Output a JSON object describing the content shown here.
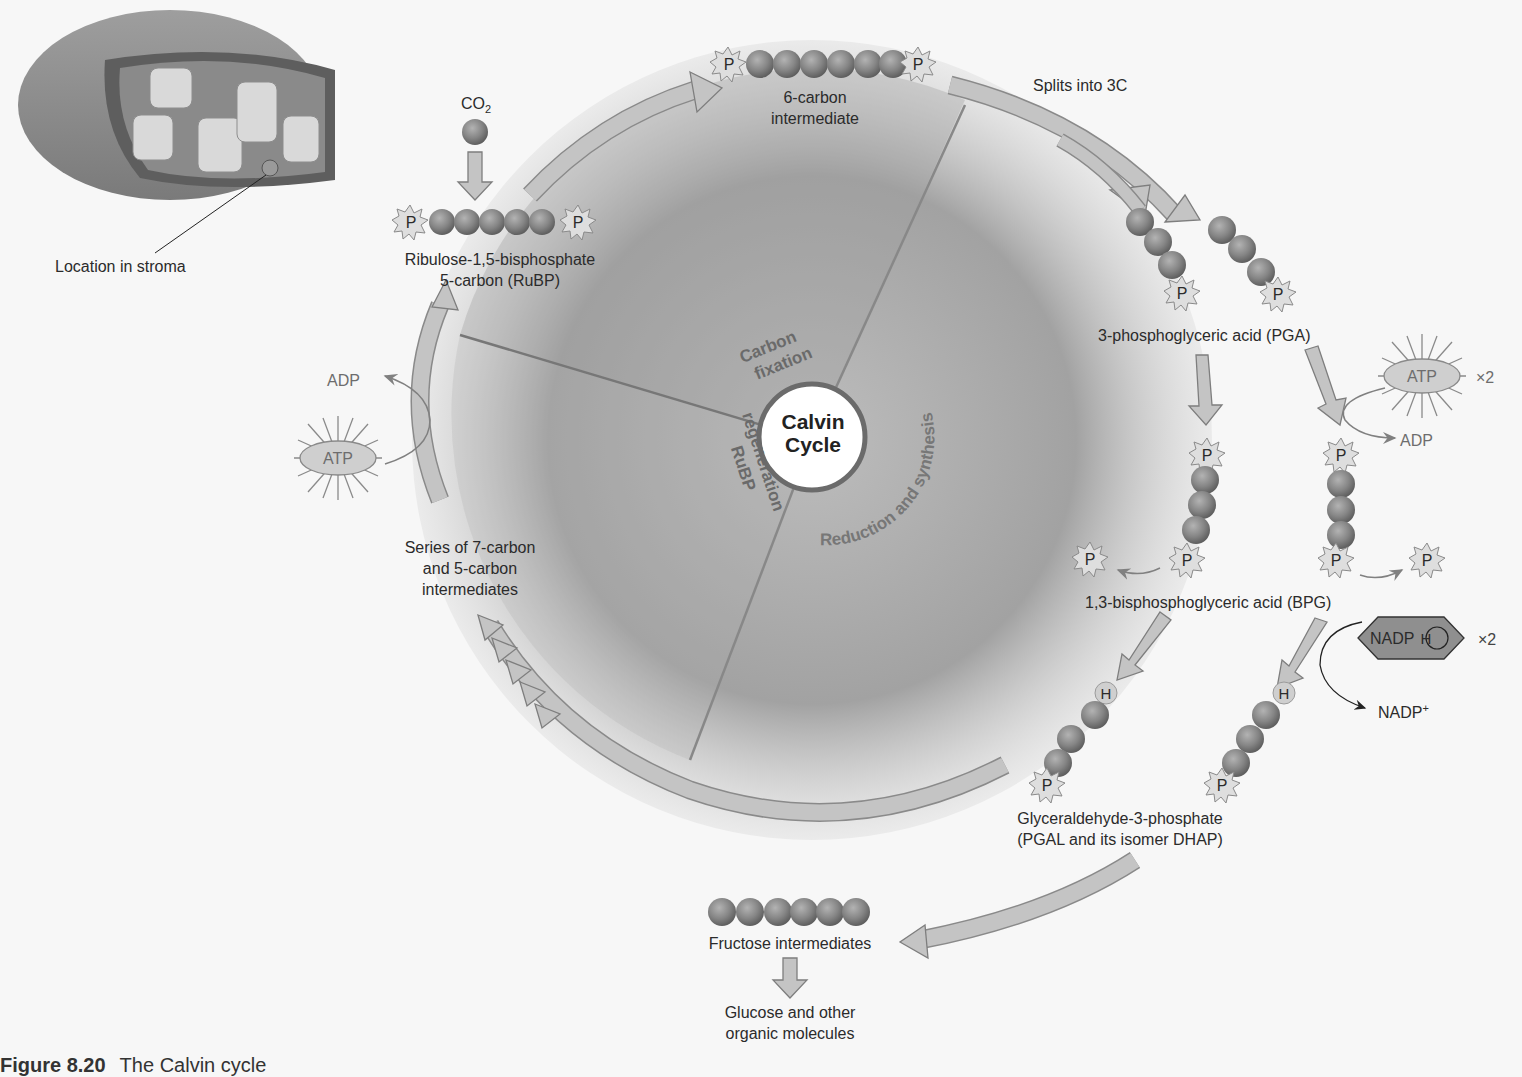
{
  "figure": {
    "caption_number": "Figure 8.20",
    "caption_text": "The Calvin cycle",
    "center": {
      "line1": "Calvin",
      "line2": "Cycle"
    },
    "phases": [
      {
        "id": "carbon-fixation",
        "line1": "Carbon",
        "line2": "fixation"
      },
      {
        "id": "reduction",
        "label": "Reduction and synthesis"
      },
      {
        "id": "rubp-regeneration",
        "line1": "RuBP",
        "line2": "regeneration"
      }
    ],
    "chloroplast": {
      "label": "Location in stroma"
    },
    "co2": {
      "label": "CO",
      "subscript": "2"
    },
    "rubp": {
      "line1": "Ribulose-1,5-bisphosphate",
      "line2": "5-carbon (RuBP)"
    },
    "six_carbon": {
      "line1": "6-carbon",
      "line2": "intermediate"
    },
    "splits": {
      "label": "Splits into 3C"
    },
    "pga": {
      "label": "3-phosphoglyceric acid (PGA)"
    },
    "atp_right": {
      "label": "ATP",
      "multiplier": "×2",
      "product": "ADP"
    },
    "bpg": {
      "label": "1,3-bisphosphoglyceric acid (BPG)"
    },
    "nadph": {
      "label": "NADP",
      "h": "H",
      "multiplier": "×2",
      "product": "NADP",
      "product_sup": "+"
    },
    "pgal": {
      "line1": "Glyceraldehyde-3-phosphate",
      "line2": "(PGAL and its isomer DHAP)"
    },
    "fructose": {
      "label": "Fructose intermediates"
    },
    "glucose": {
      "line1": "Glucose and other",
      "line2": "organic molecules"
    },
    "series": {
      "line1": "Series of 7-carbon",
      "line2": "and 5-carbon",
      "line3": "intermediates"
    },
    "atp_left": {
      "label": "ATP",
      "product": "ADP"
    },
    "phosphate_symbol": "P",
    "hydrogen_symbol": "H"
  },
  "colors": {
    "background": "#f7f7f7",
    "arrow_fill": "#bcbcbc",
    "arrow_stroke": "#8a8a8a",
    "carbon_ball": "#8a8a8a",
    "phosphate_star": "#dcdcdc",
    "nadph_fill": "#8f8f8f",
    "phase_text": "#6a6a6a"
  }
}
